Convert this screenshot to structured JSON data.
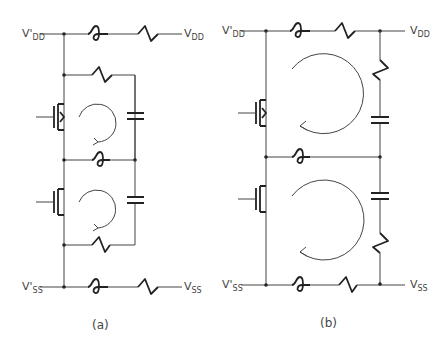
{
  "diagram": {
    "panels": [
      {
        "id": "a",
        "caption": "(a)",
        "labels": {
          "vdd_prime": {
            "main": "V",
            "sub": "DD",
            "prime": "'"
          },
          "vdd": {
            "main": "V",
            "sub": "DD"
          },
          "vss_prime": {
            "main": "V",
            "sub": "SS",
            "prime": "'"
          },
          "vss": {
            "main": "V",
            "sub": "SS"
          }
        },
        "components": [
          "supply inductor (VDD)",
          "supply resistor (VDD)",
          "resistor top loop",
          "pMOS transistor",
          "capacitor top loop",
          "shared inductor",
          "nMOS transistor",
          "capacitor bottom loop",
          "resistor bottom loop",
          "supply inductor (VSS)",
          "supply resistor (VSS)"
        ],
        "loops": 2
      },
      {
        "id": "b",
        "caption": "(b)",
        "labels": {
          "vdd_prime": {
            "main": "V",
            "sub": "DD",
            "prime": "'"
          },
          "vdd": {
            "main": "V",
            "sub": "DD"
          },
          "vss_prime": {
            "main": "V",
            "sub": "SS",
            "prime": "'"
          },
          "vss": {
            "main": "V",
            "sub": "SS"
          }
        },
        "components": [
          "supply inductor (VDD)",
          "supply resistor (VDD)",
          "vertical resistor top",
          "pMOS transistor",
          "capacitor top",
          "shared inductor",
          "nMOS transistor",
          "capacitor bottom",
          "vertical resistor bottom",
          "supply inductor (VSS)",
          "supply resistor (VSS)"
        ],
        "loops": 2
      }
    ]
  }
}
